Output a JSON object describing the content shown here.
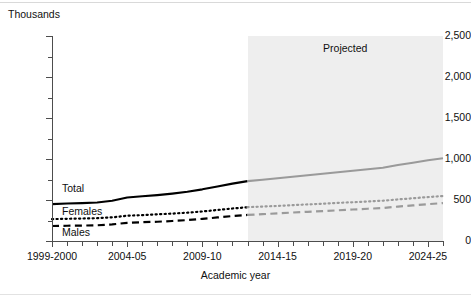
{
  "figure": {
    "unit_label": "Thousands",
    "projected_label": "Projected",
    "xlabel": "Academic year",
    "series_labels": {
      "total": "Total",
      "females": "Females",
      "males": "Males"
    }
  },
  "chart_data": {
    "type": "line",
    "title": "",
    "subtitle": "",
    "xlabel": "Academic year",
    "ylabel": "Thousands",
    "ylim": [
      0,
      2500
    ],
    "yticks": [
      0,
      500,
      1000,
      1500,
      2000,
      2500
    ],
    "ytick_labels": [
      "0",
      "500",
      "1,000",
      "1,500",
      "2,000",
      "2,500"
    ],
    "yminor_step": 250,
    "grid": false,
    "legend": "inline-labels",
    "x": [
      "1999-2000",
      "2000-01",
      "2001-02",
      "2002-03",
      "2003-04",
      "2004-05",
      "2005-06",
      "2006-07",
      "2007-08",
      "2008-09",
      "2009-10",
      "2010-11",
      "2011-12",
      "2012-13",
      "2013-14",
      "2014-15",
      "2015-16",
      "2016-17",
      "2017-18",
      "2018-19",
      "2019-20",
      "2020-21",
      "2021-22",
      "2022-23",
      "2023-24",
      "2024-25",
      "2025-26"
    ],
    "xtick_labels": [
      "1999-2000",
      "2004-05",
      "2009-10",
      "2014-15",
      "2019-20",
      "2024-25"
    ],
    "xtick_positions": [
      0,
      5,
      10,
      15,
      20,
      25
    ],
    "projection_start_index": 13,
    "projection_start_label": "2012-13",
    "annotations": [
      {
        "text": "Projected",
        "region": "2012-13 to 2025-26"
      },
      {
        "text": "Total",
        "series": "total"
      },
      {
        "text": "Females",
        "series": "females"
      },
      {
        "text": "Males",
        "series": "males"
      }
    ],
    "series": [
      {
        "name": "Total",
        "style": "solid",
        "color_actual": "#000000",
        "color_projected": "#9a9a9a",
        "values": [
          450,
          457,
          462,
          470,
          490,
          530,
          545,
          560,
          578,
          600,
          630,
          665,
          700,
          730,
          747,
          765,
          784,
          802,
          820,
          838,
          857,
          875,
          893,
          927,
          955,
          985,
          1010
        ]
      },
      {
        "name": "Females",
        "style": "dotted",
        "color_actual": "#000000",
        "color_projected": "#9a9a9a",
        "values": [
          267,
          271,
          274,
          278,
          288,
          308,
          316,
          325,
          334,
          345,
          360,
          378,
          396,
          412,
          420,
          428,
          437,
          446,
          455,
          464,
          473,
          482,
          491,
          507,
          521,
          536,
          548
        ]
      },
      {
        "name": "Males",
        "style": "dashed",
        "color_actual": "#000000",
        "color_projected": "#9a9a9a",
        "values": [
          183,
          186,
          188,
          192,
          202,
          222,
          229,
          235,
          244,
          255,
          270,
          287,
          304,
          318,
          327,
          337,
          347,
          356,
          365,
          374,
          384,
          393,
          402,
          420,
          434,
          449,
          462
        ]
      }
    ]
  }
}
